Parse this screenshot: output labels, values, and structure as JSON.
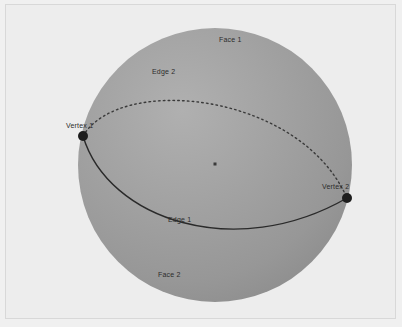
{
  "figure": {
    "background_color": "#ededed",
    "frame_color": "#d8d8d8",
    "page_background": "#f0f0f0",
    "width": 402,
    "height": 327
  },
  "sphere": {
    "name": "sphere",
    "center_x": 215,
    "center_y": 165,
    "radius": 137,
    "fill_color": "#9b9b9b",
    "highlight_color": "#aeaeae",
    "shadow_color": "#8e8e8e"
  },
  "center_point": {
    "label": "center-dot",
    "x": 215,
    "y": 164,
    "size": 3,
    "color": "#3a3a3a"
  },
  "vertices": [
    {
      "label": "Vertex 1",
      "x": 83,
      "y": 136,
      "radius": 5,
      "color": "#1d1d1d",
      "label_x": 66,
      "label_y": 122
    },
    {
      "label": "Vertex 2",
      "x": 347,
      "y": 198,
      "radius": 5,
      "color": "#1d1d1d",
      "label_x": 322,
      "label_y": 183
    }
  ],
  "edges": [
    {
      "label": "Edge 1",
      "style": "solid",
      "color": "#2a2a2a",
      "width": 1.4,
      "description": "front great-circle arc, bulging downward",
      "label_x": 168,
      "label_y": 216
    },
    {
      "label": "Edge 2",
      "style": "dashed",
      "color": "#3a3a3a",
      "width": 1.4,
      "dash": "1.6 3.2",
      "description": "back great-circle arc, bulging upward",
      "label_x": 152,
      "label_y": 68
    }
  ],
  "faces": [
    {
      "label": "Face 1",
      "label_x": 219,
      "label_y": 36
    },
    {
      "label": "Face 2",
      "label_x": 158,
      "label_y": 271
    }
  ]
}
